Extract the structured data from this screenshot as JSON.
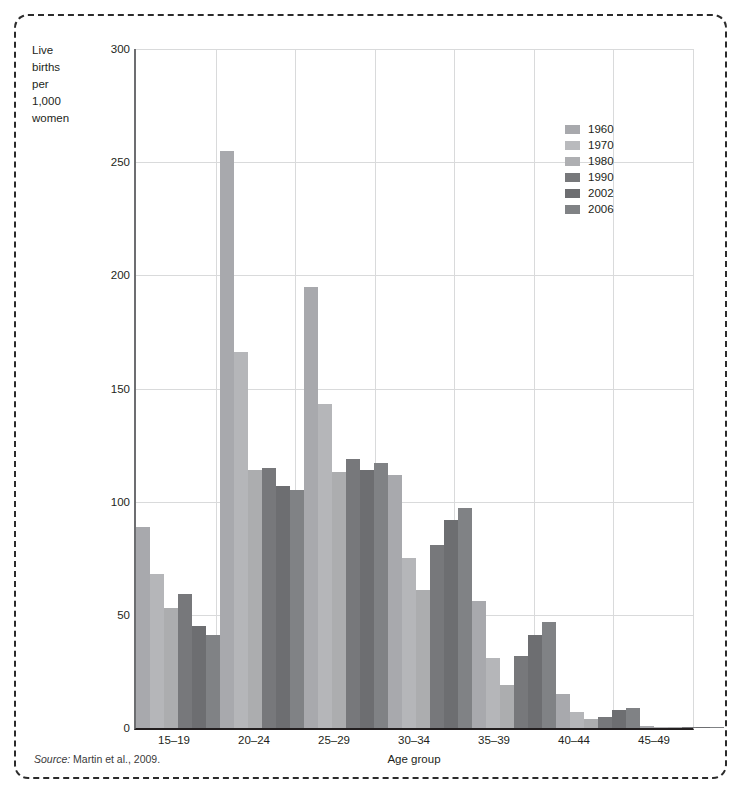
{
  "figure": {
    "y_axis_title_lines": [
      "Live",
      "births",
      "per",
      "1,000",
      "women"
    ],
    "x_axis_title": "Age group",
    "source_prefix": "Source:",
    "source_text": "Martin et al., 2009."
  },
  "chart_data": {
    "type": "bar",
    "title": "",
    "subtitle": "",
    "xlabel": "Age group",
    "ylabel": "Live births per 1,000 women",
    "ylim": [
      0,
      300
    ],
    "yticks": [
      0,
      50,
      100,
      150,
      200,
      250,
      300
    ],
    "grid": true,
    "legend_position": "top-right",
    "categories": [
      "15–19",
      "20–24",
      "25–29",
      "30–34",
      "35–39",
      "40–44",
      "45–49"
    ],
    "series": [
      {
        "name": "1960",
        "color": "#a8a9ad",
        "values": [
          89,
          255,
          195,
          112,
          56,
          15,
          0.8
        ]
      },
      {
        "name": "1970",
        "color": "#b5b6b9",
        "values": [
          68,
          166,
          143,
          75,
          31,
          7,
          0.5
        ]
      },
      {
        "name": "1980",
        "color": "#acadaf",
        "values": [
          53,
          114,
          113,
          61,
          19,
          4,
          0.3
        ]
      },
      {
        "name": "1990",
        "color": "#77787b",
        "values": [
          59,
          115,
          119,
          81,
          32,
          5,
          0.3
        ]
      },
      {
        "name": "2002",
        "color": "#6d6e71",
        "values": [
          45,
          107,
          114,
          92,
          41,
          8,
          0.5
        ]
      },
      {
        "name": "2006",
        "color": "#808285",
        "values": [
          41,
          105,
          117,
          97,
          47,
          9,
          0.6
        ]
      }
    ]
  },
  "legend": {
    "items": [
      {
        "label": "1960",
        "color": "#a8a9ad"
      },
      {
        "label": "1970",
        "color": "#b9babd"
      },
      {
        "label": "1980",
        "color": "#aeafb2"
      },
      {
        "label": "1990",
        "color": "#77787b"
      },
      {
        "label": "2002",
        "color": "#6d6e71"
      },
      {
        "label": "2006",
        "color": "#808285"
      }
    ]
  }
}
